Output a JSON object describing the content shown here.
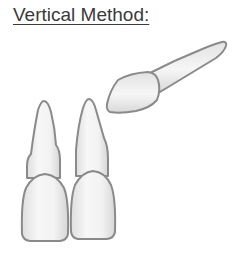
{
  "title": "Vertical Method:",
  "diagram": {
    "teeth": [
      {
        "id": "left-tooth",
        "orientation": "vertical"
      },
      {
        "id": "middle-tooth",
        "orientation": "vertical"
      },
      {
        "id": "tilted-tooth",
        "orientation": "diagonal"
      }
    ],
    "colors": {
      "outline": "#8a8a8a",
      "fill_light": "#f6f6f6",
      "fill_shade": "#dcdcdc",
      "title_text": "#3a3a3a"
    }
  }
}
